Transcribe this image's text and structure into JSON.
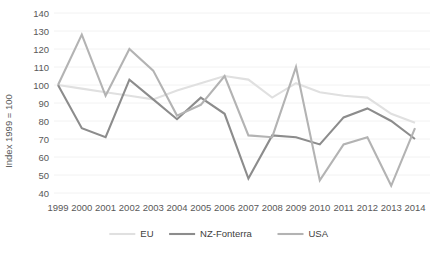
{
  "chart_data": {
    "type": "line",
    "title": "",
    "xlabel": "",
    "ylabel": "Index 1999 = 100",
    "ylim": [
      40,
      140
    ],
    "ytick_step": 10,
    "grid": true,
    "legend_position": "bottom",
    "categories": [
      "1999",
      "2000",
      "2001",
      "2002",
      "2003",
      "2004",
      "2005",
      "2006",
      "2007",
      "2008",
      "2009",
      "2010",
      "2011",
      "2012",
      "2013",
      "2014"
    ],
    "yticks": [
      "40",
      "50",
      "60",
      "70",
      "80",
      "90",
      "100",
      "110",
      "120",
      "130",
      "140"
    ],
    "series": [
      {
        "name": "EU",
        "color": "#e0e0e0",
        "stroke_width": 2.1,
        "values": [
          100,
          98,
          96,
          94,
          92,
          97,
          101,
          105,
          103,
          93,
          101,
          96,
          94,
          93,
          84,
          79
        ]
      },
      {
        "name": "NZ-Fonterra",
        "color": "#8c8c8c",
        "stroke_width": 2.1,
        "values": [
          100,
          76,
          71,
          103,
          92,
          81,
          93,
          84,
          48,
          72,
          71,
          67,
          82,
          87,
          80,
          70
        ]
      },
      {
        "name": "USA",
        "color": "#b3b3b3",
        "stroke_width": 2.1,
        "values": [
          100,
          128,
          94,
          120,
          108,
          83,
          89,
          105,
          72,
          71,
          110,
          47,
          67,
          71,
          44,
          76
        ]
      }
    ]
  },
  "legend": {
    "items": [
      {
        "label": "EU",
        "color": "#e0e0e0"
      },
      {
        "label": "NZ-Fonterra",
        "color": "#8c8c8c"
      },
      {
        "label": "USA",
        "color": "#b3b3b3"
      }
    ]
  },
  "colors": {
    "background": "#ffffff",
    "grid": "#f2f2f2",
    "tick_text": "#595959",
    "legend_text": "#404040"
  }
}
